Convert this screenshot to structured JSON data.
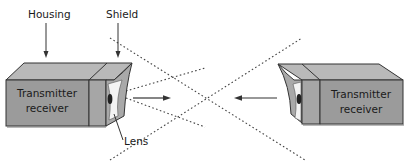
{
  "diagram": {
    "type": "photoelectric-sensor-beam-diagram",
    "labels": {
      "housing": "Housing",
      "shield": "Shield",
      "lens": "Lens"
    },
    "left_unit": {
      "line1": "Transmitter",
      "line2": "receiver"
    },
    "right_unit": {
      "line1": "Transmitter",
      "line2": "receiver"
    },
    "beam": {
      "style": "dotted",
      "left_arrow_direction": "right",
      "right_arrow_direction": "left"
    },
    "colors": {
      "housing_front": "#9a9a9a",
      "housing_top": "#b8b8b8",
      "shield": "#a8a8a8",
      "outline": "#333333",
      "beam": "#444444"
    }
  }
}
